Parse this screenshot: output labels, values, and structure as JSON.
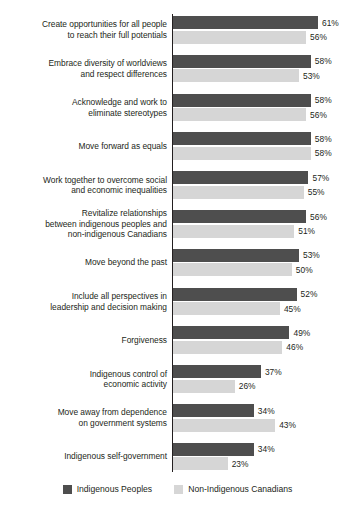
{
  "chart_data": {
    "type": "bar",
    "orientation": "horizontal",
    "title": "",
    "subtitle": "",
    "xlabel": "",
    "ylabel": "",
    "xlim": [
      0,
      61
    ],
    "grid": false,
    "legend_position": "bottom",
    "value_suffix": "%",
    "categories": [
      "Create opportunities for all people to reach their full potentials",
      "Embrace diversity of worldviews and respect differences",
      "Acknowledge and work to eliminate stereotypes",
      "Move forward as equals",
      "Work together to overcome social and economic inequalities",
      "Revitalize relationships between indigenous peoples and non-indigenous Canadians",
      "Move beyond the past",
      "Include all perspectives in leadership and decision making",
      "Forgiveness",
      "Indigenous control of economic activity",
      "Move away from dependence on government systems",
      "Indigenous self-government"
    ],
    "category_lines": [
      [
        "Create opportunities for all people",
        "to reach their full potentials"
      ],
      [
        "Embrace diversity of worldviews",
        "and respect differences"
      ],
      [
        "Acknowledge and work to",
        "eliminate stereotypes"
      ],
      [
        "Move forward as equals"
      ],
      [
        "Work together to overcome social",
        "and economic inequalities"
      ],
      [
        "Revitalize relationships",
        "between indigenous peoples and",
        "non-indigenous Canadians"
      ],
      [
        "Move beyond the past"
      ],
      [
        "Include all perspectives in",
        "leadership and decision making"
      ],
      [
        "Forgiveness"
      ],
      [
        "Indigenous control of",
        "economic activity"
      ],
      [
        "Move away from dependence",
        "on government systems"
      ],
      [
        "Indigenous self-government"
      ]
    ],
    "series": [
      {
        "name": "Indigenous Peoples",
        "color": "#4e4e4e",
        "values": [
          61,
          58,
          58,
          58,
          57,
          56,
          53,
          52,
          49,
          37,
          34,
          34
        ],
        "labels": [
          "61%",
          "58%",
          "58%",
          "58%",
          "57%",
          "56%",
          "53%",
          "52%",
          "49%",
          "37%",
          "34%",
          "34%"
        ]
      },
      {
        "name": "Non-Indigenous Canadians",
        "color": "#d6d6d6",
        "values": [
          56,
          53,
          56,
          58,
          55,
          51,
          50,
          45,
          46,
          26,
          43,
          23
        ],
        "labels": [
          "56%",
          "53%",
          "56%",
          "58%",
          "55%",
          "51%",
          "50%",
          "45%",
          "46%",
          "26%",
          "43%",
          "23%"
        ]
      }
    ]
  },
  "legend": {
    "items": [
      {
        "label": "Indigenous Peoples",
        "swatch": "dark"
      },
      {
        "label": "Non-Indigenous Canadians",
        "swatch": "light"
      }
    ]
  }
}
